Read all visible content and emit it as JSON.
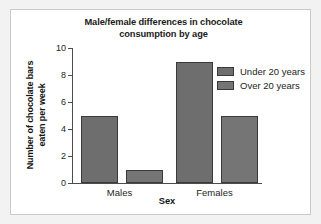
{
  "chart_data": {
    "type": "bar",
    "title": "Male/female differences in chocolate consumption by age",
    "title_line1": "Male/female differences in chocolate",
    "title_line2": "consumption by age",
    "xlabel": "Sex",
    "ylabel": "Number of chocolate bars eaten per week",
    "ylabel_line1": "Number of chocolate bars",
    "ylabel_line2": "eaten per week",
    "categories": [
      "Males",
      "Females"
    ],
    "series": [
      {
        "name": "Under 20 years",
        "values": [
          5,
          9
        ],
        "color": "#6e6e6e"
      },
      {
        "name": "Over 20 years",
        "values": [
          1,
          5
        ],
        "color": "#757575"
      }
    ],
    "ylim": [
      0,
      10
    ],
    "yticks": [
      0,
      2,
      4,
      6,
      8,
      10
    ],
    "ytick_labels": [
      "0",
      "2",
      "4",
      "6",
      "8",
      "10"
    ],
    "grid": false,
    "legend_position": "upper right",
    "axis_color": "#4d4d4d",
    "bar_outline_color": "#3a3a3a"
  },
  "figure": {
    "background": "#f2f2f2",
    "card_background": "#ffffff",
    "card_border": "#c9c9c9"
  }
}
